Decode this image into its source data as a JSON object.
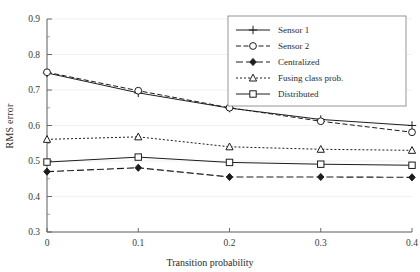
{
  "chart_data": {
    "type": "line",
    "title": "",
    "xlabel": "Transition probability",
    "ylabel": "RMS error",
    "x": [
      0,
      0.1,
      0.2,
      0.3,
      0.4
    ],
    "xtick_labels": [
      "0",
      "0.1",
      "0.2",
      "0.3",
      "0.4"
    ],
    "ytick_labels": [
      "0.3",
      "0.4",
      "0.5",
      "0.6",
      "0.7",
      "0.8",
      "0.9"
    ],
    "ytick_values": [
      0.3,
      0.4,
      0.5,
      0.6,
      0.7,
      0.8,
      0.9
    ],
    "xlim": [
      0,
      0.4
    ],
    "ylim": [
      0.3,
      0.9
    ],
    "grid": "horizontal-faint",
    "minor_ticks_y": [
      0.35,
      0.45,
      0.55,
      0.65,
      0.75,
      0.85
    ],
    "legend_position": "top-right",
    "series": [
      {
        "name": "Sensor 1",
        "values": [
          0.748,
          0.692,
          0.649,
          0.617,
          0.6
        ],
        "marker": "plus",
        "linestyle": "solid",
        "color": "#1d1d1d"
      },
      {
        "name": "Sensor 2",
        "values": [
          0.75,
          0.698,
          0.65,
          0.612,
          0.581
        ],
        "marker": "circle-open",
        "linestyle": "dashed",
        "color": "#1d1d1d"
      },
      {
        "name": "Centralized",
        "values": [
          0.47,
          0.481,
          0.455,
          0.455,
          0.454
        ],
        "marker": "diamond-filled",
        "linestyle": "dashdot",
        "color": "#1d1d1d"
      },
      {
        "name": "Fusing class prob.",
        "values": [
          0.561,
          0.568,
          0.54,
          0.533,
          0.53
        ],
        "marker": "triangle-open",
        "linestyle": "dotted",
        "color": "#1d1d1d"
      },
      {
        "name": "Distributed",
        "values": [
          0.497,
          0.511,
          0.496,
          0.491,
          0.488
        ],
        "marker": "square-open",
        "linestyle": "solid",
        "color": "#1d1d1d"
      }
    ]
  },
  "axes": {
    "y_axis_label": "RMS error",
    "x_axis_label": "Transition probability"
  },
  "legend": {
    "entries": [
      {
        "label": "Sensor 1"
      },
      {
        "label": "Sensor 2"
      },
      {
        "label": "Centralized"
      },
      {
        "label": "Fusing class prob."
      },
      {
        "label": "Distributed"
      }
    ]
  },
  "colors": {
    "background": "#ffffff",
    "ink": "#1d1d1d",
    "frame": "#5a5a5a",
    "grid": "#ededed"
  }
}
